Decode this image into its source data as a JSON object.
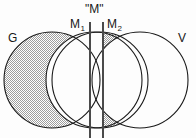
{
  "figure": {
    "type": "venn-diagram",
    "labels": {
      "left_circle": "G",
      "right_circle": "V",
      "middle_left_circle_base": "M",
      "middle_left_circle_sub": "1",
      "middle_right_circle_base": "M",
      "middle_right_circle_sub": "2",
      "boundary_label": "\"M\""
    },
    "colors": {
      "stroke": "#1a1a1a",
      "background": "#fdfdfd",
      "shading": "#c9c9c9",
      "boundary_line": "#4a4a4a"
    },
    "circles": [
      {
        "name": "G",
        "cx": 52,
        "cy": 80,
        "r": 48,
        "shaded": true
      },
      {
        "name": "M1",
        "cx": 94,
        "cy": 80,
        "r": 48,
        "shaded": false
      },
      {
        "name": "M2",
        "cx": 100,
        "cy": 80,
        "r": 48,
        "shaded": true
      },
      {
        "name": "V",
        "cx": 140,
        "cy": 80,
        "r": 48,
        "shaded": false
      }
    ],
    "boundary_lines": [
      {
        "name": "line-left",
        "x": 90,
        "y1": 22,
        "y2": 137
      },
      {
        "name": "line-right",
        "x": 103,
        "y1": 22,
        "y2": 137
      }
    ]
  }
}
